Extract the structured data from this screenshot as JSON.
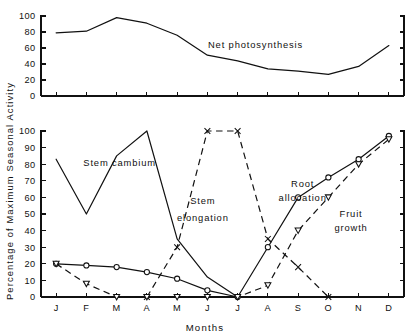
{
  "figure": {
    "y_axis_title": "Percentage of Maximum Seasonal Activity",
    "x_axis_title": "Months"
  },
  "chart_data": [
    {
      "type": "line",
      "title": "",
      "panel": "top",
      "xlabel": "",
      "ylabel": "Percentage of Maximum Seasonal Activity",
      "categories": [
        "J",
        "F",
        "M",
        "A",
        "M",
        "J",
        "J",
        "A",
        "S",
        "O",
        "N",
        "D"
      ],
      "x": [
        1,
        2,
        3,
        4,
        5,
        6,
        7,
        8,
        9,
        10,
        11,
        12
      ],
      "ylim": [
        0,
        100
      ],
      "yticks": [
        0,
        20,
        40,
        60,
        80,
        100
      ],
      "ytick_labels": [
        "0",
        "20",
        "40",
        "60",
        "80",
        "100"
      ],
      "grid": false,
      "legend": "inline-annotation",
      "series": [
        {
          "name": "Net photosynthesis",
          "label_text": "Net photosynthesis",
          "linestyle": "solid",
          "marker": "none",
          "values": [
            79,
            81,
            98,
            91,
            76,
            51,
            44,
            34,
            31,
            27,
            37,
            63
          ]
        }
      ]
    },
    {
      "type": "line",
      "title": "",
      "panel": "bottom",
      "xlabel": "Months",
      "ylabel": "Percentage of Maximum Seasonal Activity",
      "categories": [
        "J",
        "F",
        "M",
        "A",
        "M",
        "J",
        "J",
        "A",
        "S",
        "O",
        "N",
        "D"
      ],
      "x": [
        1,
        2,
        3,
        4,
        5,
        6,
        7,
        8,
        9,
        10,
        11,
        12
      ],
      "ylim": [
        0,
        100
      ],
      "yticks": [
        0,
        10,
        20,
        30,
        40,
        50,
        60,
        70,
        80,
        90,
        100
      ],
      "ytick_labels": [
        "0",
        "10",
        "20",
        "30",
        "40",
        "50",
        "60",
        "70",
        "80",
        "90",
        "100"
      ],
      "grid": false,
      "legend": "inline-annotation",
      "series": [
        {
          "name": "Stem cambium",
          "label_text": "Stem cambium",
          "linestyle": "solid",
          "marker": "none",
          "x": [
            1,
            2,
            3,
            4,
            5,
            6,
            7
          ],
          "values": [
            83,
            50,
            85,
            100,
            35,
            12,
            0
          ]
        },
        {
          "name": "Stem elongation",
          "label_text": "Stem elongation",
          "linestyle": "dashed",
          "marker": "x",
          "x": [
            4,
            5,
            6,
            7,
            8,
            9,
            10
          ],
          "values": [
            0,
            30,
            100,
            100,
            35,
            18,
            0
          ]
        },
        {
          "name": "Root allocation",
          "label_text": "Root allocation",
          "linestyle": "solid",
          "marker": "circle",
          "x": [
            1,
            2,
            3,
            4,
            5,
            6,
            7,
            8,
            9,
            10,
            11,
            12
          ],
          "values": [
            20,
            19,
            18,
            15,
            11,
            4,
            0,
            30,
            60,
            72,
            83,
            97
          ]
        },
        {
          "name": "Fruit growth",
          "label_text": "Fruit growth",
          "linestyle": "dashed",
          "marker": "triangle-down",
          "x": [
            1,
            2,
            3,
            4,
            5,
            6,
            7,
            8,
            9,
            10,
            11,
            12
          ],
          "values": [
            20,
            8,
            0,
            0,
            0,
            0,
            0,
            7,
            40,
            60,
            80,
            95
          ]
        }
      ],
      "annotations": [
        {
          "text": "Stem cambium",
          "x_month": 3.1,
          "y_value": 79
        },
        {
          "text": "Stem",
          "x_month": 5.85,
          "y_value": 56
        },
        {
          "text": "elongation",
          "x_month": 5.85,
          "y_value": 46
        },
        {
          "text": "Root",
          "x_month": 9.15,
          "y_value": 66
        },
        {
          "text": "allocation",
          "x_month": 9.15,
          "y_value": 58
        },
        {
          "text": "Fruit",
          "x_month": 10.75,
          "y_value": 48
        },
        {
          "text": "growth",
          "x_month": 10.75,
          "y_value": 40
        }
      ]
    }
  ]
}
